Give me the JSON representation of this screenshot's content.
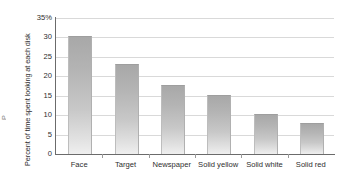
{
  "chart_data": {
    "type": "bar",
    "title": "",
    "xlabel": "",
    "ylabel": "Percent of time spent looking at each disk",
    "categories": [
      "Face",
      "Target",
      "Newspaper",
      "Solid yellow",
      "Solid white",
      "Solid red"
    ],
    "values": [
      30,
      22.8,
      17.5,
      15,
      10,
      7.7
    ],
    "ylim": [
      0,
      35
    ],
    "yticks": [
      "0",
      "5",
      "10",
      "15",
      "20",
      "25",
      "30",
      "35%"
    ],
    "ytick_values": [
      0,
      5,
      10,
      15,
      20,
      25,
      30,
      35
    ],
    "grid": "horizontal",
    "legend": "none",
    "bar_color": "#bdbdbd",
    "grid_color": "#d9d9d9",
    "axis_color": "#6b6b6b",
    "background": "#ffffff",
    "edge_clipped_text": "P"
  }
}
